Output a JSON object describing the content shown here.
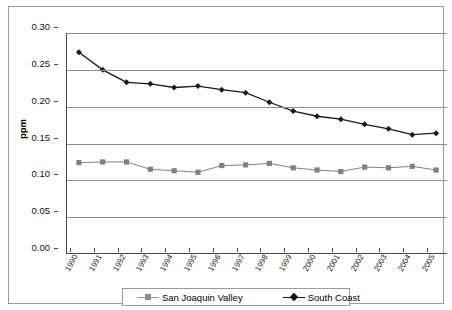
{
  "chart_data": {
    "type": "line",
    "title": "",
    "xlabel": "",
    "ylabel": "ppm",
    "ylim": [
      0.0,
      0.3
    ],
    "ytick_labels": [
      "0.30",
      "0.25",
      "0.20",
      "0.15",
      "0.10",
      "0.05",
      "0.00"
    ],
    "ytick_values": [
      0.3,
      0.25,
      0.2,
      0.15,
      0.1,
      0.05,
      0.0
    ],
    "grid": true,
    "legend_position": "bottom",
    "categories": [
      "1990",
      "1991",
      "1992",
      "1993",
      "1994",
      "1995",
      "1996",
      "1997",
      "1998",
      "1999",
      "2000",
      "2001",
      "2002",
      "2003",
      "2004",
      "2005"
    ],
    "series": [
      {
        "name": "San Joaquin Valley",
        "marker": "square",
        "color": "#808080",
        "values": [
          0.124,
          0.125,
          0.125,
          0.115,
          0.113,
          0.111,
          0.12,
          0.121,
          0.123,
          0.117,
          0.114,
          0.112,
          0.118,
          0.117,
          0.119,
          0.114
        ]
      },
      {
        "name": "South Coast",
        "marker": "diamond",
        "color": "#1a1a1a",
        "values": [
          0.274,
          0.25,
          0.233,
          0.231,
          0.226,
          0.228,
          0.223,
          0.219,
          0.206,
          0.194,
          0.187,
          0.183,
          0.176,
          0.17,
          0.162,
          0.164
        ]
      }
    ],
    "south_coast_extra": {
      "note": "series drawn across 16 year categories"
    }
  },
  "legend": {
    "items": [
      {
        "label": "San Joaquin Valley",
        "marker": "square-marker-icon"
      },
      {
        "label": "South Coast",
        "marker": "diamond-marker-icon"
      }
    ]
  },
  "axes": {
    "y_title": "ppm"
  }
}
